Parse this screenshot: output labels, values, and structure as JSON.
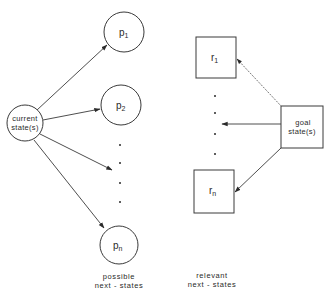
{
  "diagram": {
    "left_group": {
      "source": {
        "label_line1": "current",
        "label_line2": "state(s)"
      },
      "nodes": [
        {
          "label": "p",
          "sub": "1"
        },
        {
          "label": "p",
          "sub": "2"
        },
        {
          "label": "p",
          "sub": "n"
        }
      ],
      "caption_line1": "possible",
      "caption_line2": "next - states"
    },
    "right_group": {
      "source": {
        "label_line1": "goal",
        "label_line2": "state(s)"
      },
      "nodes": [
        {
          "label": "r",
          "sub": "1"
        },
        {
          "label": "r",
          "sub": "n"
        }
      ],
      "caption_line1": "relevant",
      "caption_line2": "next - states"
    },
    "colors": {
      "stroke": "#3a3a3a",
      "text": "#2a2a2a",
      "background": "#ffffff"
    }
  }
}
